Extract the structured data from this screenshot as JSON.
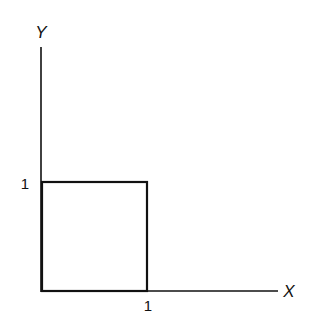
{
  "diagram": {
    "axes": {
      "y_label": "Y",
      "x_label": "X"
    },
    "ticks": {
      "y_tick": "1",
      "x_tick": "1"
    },
    "shape": "unit-square",
    "colors": {
      "stroke": "#111111",
      "background": "#ffffff"
    }
  }
}
